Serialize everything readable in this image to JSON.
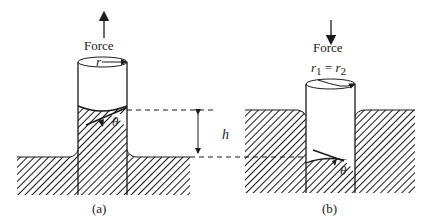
{
  "figure": {
    "panel_a": {
      "caption": "(a)",
      "force_label": "Force",
      "force_direction": "up",
      "radius_label": "r",
      "angle_label": "θ"
    },
    "panel_b": {
      "caption": "(b)",
      "force_label": "Force",
      "force_direction": "down",
      "radius_label_r1": "r",
      "radius_sub_1": "1",
      "radius_eq": " = ",
      "radius_label_r2": "r",
      "radius_sub_2": "2",
      "angle_label": "θ"
    },
    "height_label": "h",
    "colors": {
      "ink": "#1a1a1a",
      "background": "#ffffff"
    }
  }
}
